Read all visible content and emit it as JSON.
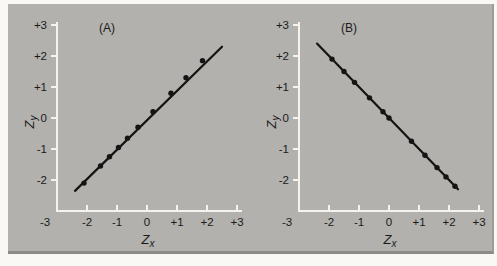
{
  "figure": {
    "panel_background": "#b2b1ad",
    "panel_edge": "#8b8a84",
    "page_background": "#f9f8f4"
  },
  "colors": {
    "axis": "#f4f3ee",
    "data": "#141414",
    "text": "#1b1b1b"
  },
  "chart_data": [
    {
      "type": "scatter",
      "panel_label": "(A)",
      "xlabel": {
        "base": "Z",
        "sub": "x"
      },
      "ylabel": {
        "base": "Z",
        "sub": "y"
      },
      "xlim": [
        -3,
        3
      ],
      "ylim": [
        -3,
        3
      ],
      "x_tick_labels": [
        "-3",
        "-2",
        "-1",
        "0",
        "+1",
        "+2",
        "+3"
      ],
      "y_tick_labels": [
        "+3",
        "+2",
        "+1",
        "0",
        "-1",
        "-2"
      ],
      "grid": false,
      "relationship": "perfect positive linear (r = +1), points lie on line zy = zx",
      "line": {
        "x1": -2.4,
        "y1": -2.35,
        "x2": 2.5,
        "y2": 2.3
      },
      "points": [
        [
          -2.1,
          -2.1
        ],
        [
          -1.55,
          -1.55
        ],
        [
          -1.25,
          -1.25
        ],
        [
          -0.95,
          -0.95
        ],
        [
          -0.65,
          -0.65
        ],
        [
          -0.3,
          -0.3
        ],
        [
          0.2,
          0.2
        ],
        [
          0.8,
          0.8
        ],
        [
          1.3,
          1.3
        ],
        [
          1.85,
          1.85
        ]
      ]
    },
    {
      "type": "scatter",
      "panel_label": "(B)",
      "xlabel": {
        "base": "Z",
        "sub": "x"
      },
      "ylabel": {
        "base": "Z",
        "sub": "y"
      },
      "xlim": [
        -3,
        3
      ],
      "ylim": [
        -3,
        3
      ],
      "x_tick_labels": [
        "-3",
        "-2",
        "-1",
        "0",
        "+1",
        "+2",
        "+3"
      ],
      "y_tick_labels": [
        "+3",
        "+2",
        "+1",
        "0",
        "-1",
        "-2"
      ],
      "grid": false,
      "relationship": "perfect negative linear (r = -1), points lie on line zy = -zx",
      "line": {
        "x1": -2.4,
        "y1": 2.4,
        "x2": 2.3,
        "y2": -2.3
      },
      "points": [
        [
          -1.9,
          1.9
        ],
        [
          -1.5,
          1.5
        ],
        [
          -1.15,
          1.15
        ],
        [
          -0.65,
          0.65
        ],
        [
          -0.2,
          0.2
        ],
        [
          0.0,
          0.0
        ],
        [
          0.75,
          -0.75
        ],
        [
          1.2,
          -1.2
        ],
        [
          1.6,
          -1.6
        ],
        [
          1.9,
          -1.9
        ],
        [
          2.2,
          -2.2
        ]
      ]
    }
  ]
}
